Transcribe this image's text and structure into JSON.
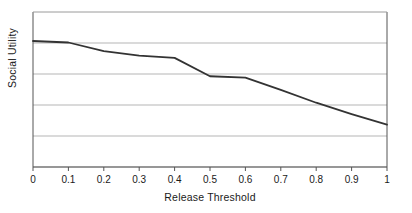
{
  "chart_data": {
    "type": "line",
    "title": "",
    "xlabel": "Release Threshold",
    "ylabel": "Social Utility",
    "x": [
      0,
      0.1,
      0.2,
      0.3,
      0.4,
      0.5,
      0.6,
      0.7,
      0.8,
      0.9,
      1
    ],
    "xtick_labels": [
      "0",
      "0.1",
      "0.2",
      "0.3",
      "0.4",
      "0.5",
      "0.6",
      "0.7",
      "0.8",
      "0.9",
      "1"
    ],
    "values": [
      5.0,
      4.94,
      4.6,
      4.42,
      4.33,
      3.6,
      3.55,
      3.06,
      2.55,
      2.1,
      1.68
    ],
    "ytick_labels": [],
    "xlim": [
      0,
      1
    ],
    "ylim": [
      0,
      6.15
    ],
    "ygrid_count": 6,
    "grid": true,
    "grid_axis": "y",
    "legend": false,
    "legend_position": "none",
    "series": [
      {
        "name": "Social Utility",
        "color": "#333333",
        "values": [
          5.0,
          4.94,
          4.6,
          4.42,
          4.33,
          3.6,
          3.55,
          3.06,
          2.55,
          2.1,
          1.68
        ]
      }
    ],
    "line_color": "#333333",
    "grid_color": "#b5b5b5",
    "axis_color": "#555555",
    "background": "#ffffff"
  }
}
